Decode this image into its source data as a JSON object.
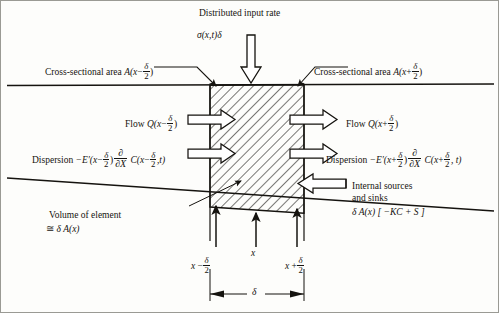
{
  "diagram": {
    "title_top": "Distributed input rate",
    "source_term": "σ(x,t)δ",
    "area_left_label": "Cross-sectional area",
    "area_left_expr_head": "A(x",
    "area_left_sign": "−",
    "area_left_num": "δ",
    "area_left_den": "2",
    "area_left_tail": ")",
    "area_right_label": "Cross-sectional area",
    "area_right_expr_head": "A(x",
    "area_right_sign": "+",
    "area_right_num": "δ",
    "area_right_den": "2",
    "area_right_tail": ")",
    "flow_left_label": "Flow",
    "flow_left_head": "Q(x",
    "flow_left_sign": "−",
    "flow_left_num": "δ",
    "flow_left_den": "2",
    "flow_left_tail": ")",
    "flow_right_label": "Flow",
    "flow_right_head": "Q(x",
    "flow_right_sign": "+",
    "flow_right_num": "δ",
    "flow_right_den": "2",
    "flow_right_tail": ")",
    "disp_left_label": "Dispersion",
    "disp_left_coeff": "−E′(x",
    "disp_left_sign": "−",
    "disp_left_num": "δ",
    "disp_left_den": "2",
    "disp_left_close": ")",
    "disp_partial_num": "∂",
    "disp_partial_den": "∂X",
    "disp_left_conc_head": "C(x",
    "disp_left_conc_sign": "−",
    "disp_left_conc_num": "δ",
    "disp_left_conc_den": "2",
    "disp_left_conc_tail": ",t)",
    "disp_right_label": "Dispersion",
    "disp_right_coeff": "−E′(x",
    "disp_right_sign": "+",
    "disp_right_num": "δ",
    "disp_right_den": "2",
    "disp_right_close": ")",
    "disp_right_conc_head": "C(x",
    "disp_right_conc_sign": "+",
    "disp_right_conc_num": "δ",
    "disp_right_conc_den": "2",
    "disp_right_conc_tail": ", t)",
    "internal_line1": "Internal sources",
    "internal_line2": "and sinks",
    "internal_expr": "δ A(x) [ −KC + S ]",
    "volume_label": "Volume of element",
    "volume_approx": "≅",
    "volume_expr": "δ A(x)",
    "axis_center": "x",
    "axis_left_head": "x",
    "axis_left_sign": "−",
    "axis_left_num": "δ",
    "axis_left_den": "2",
    "axis_right_head": "x",
    "axis_right_sign": "+",
    "axis_right_num": "δ",
    "axis_right_den": "2",
    "width_label": "δ"
  },
  "colors": {
    "ink": "#15130f",
    "paper": "#fdfdfb",
    "frame": "#9a9a94",
    "hatch": "#15130f"
  }
}
